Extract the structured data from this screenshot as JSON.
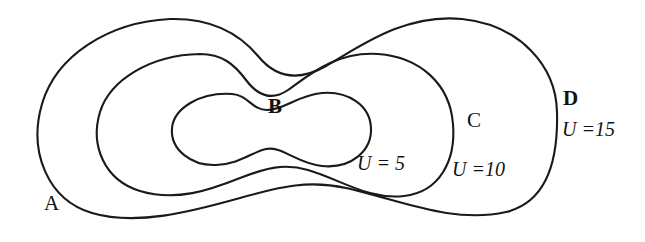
{
  "figure": {
    "type": "equipotential-contour-diagram",
    "background_color": "#ffffff",
    "line_color": "#1a1a1a",
    "region_labels": [
      {
        "id": "A",
        "text": "A",
        "style": "plain",
        "x": 44,
        "y": 193
      },
      {
        "id": "B",
        "text": "B",
        "style": "bold",
        "x": 268,
        "y": 96
      },
      {
        "id": "C",
        "text": "C",
        "style": "plain",
        "x": 467,
        "y": 110
      },
      {
        "id": "D",
        "text": "D",
        "style": "bold",
        "x": 563,
        "y": 88
      }
    ],
    "value_labels": [
      {
        "id": "u5",
        "variable": "U",
        "equals": "=",
        "value": "5",
        "text": "U = 5",
        "x": 357,
        "y": 153
      },
      {
        "id": "u10",
        "variable": "U",
        "equals": "=",
        "value": "10",
        "text": "U =10",
        "x": 452,
        "y": 159
      },
      {
        "id": "u15",
        "variable": "U",
        "equals": "=",
        "value": "15",
        "text": "U =15",
        "x": 562,
        "y": 119
      }
    ]
  },
  "chart_data": {
    "type": "line",
    "title": "",
    "xlabel": "",
    "ylabel": "",
    "grid": false,
    "legend": "none",
    "series": [
      {
        "name": "U = 5",
        "label": "U = 5",
        "value": 5,
        "region": "B",
        "closed": true,
        "shape": "peanut",
        "bbox": {
          "x_min": 170,
          "x_max": 372,
          "y_min": 93,
          "y_max": 167
        },
        "waist_x": 267,
        "path": "M 232 94 C 200 92 174 108 172 128 C 170 150 192 166 216 165 C 240 164 252 152 266 149 C 282 146 296 163 322 166 C 352 169 372 150 371 128 C 370 105 348 91 322 93 C 298 95 284 110 267 110 C 252 110 248 95 232 94 Z"
      },
      {
        "name": "U = 10",
        "label": "U =10",
        "value": 10,
        "region": "C",
        "closed": true,
        "shape": "peanut",
        "bbox": {
          "x_min": 96,
          "x_max": 456,
          "y_min": 53,
          "y_max": 200
        },
        "waist_x": 272,
        "path": "M 200 54 C 150 55 110 80 100 112 C 90 145 104 180 140 191 C 176 202 210 190 240 178 C 266 168 284 163 308 170 C 342 180 368 200 404 196 C 440 192 456 160 453 124 C 450 84 420 57 378 54 C 336 51 308 76 288 90 C 272 101 258 96 246 80 C 234 64 222 54 200 54 Z"
      },
      {
        "name": "U = 15",
        "label": "U =15",
        "value": 15,
        "region": "D",
        "closed": true,
        "shape": "peanut",
        "bbox": {
          "x_min": 38,
          "x_max": 558,
          "y_min": 18,
          "y_max": 222
        },
        "waist_x": 280,
        "path": "M 170 19 C 108 22 56 56 42 104 C 28 152 48 200 92 213 C 136 226 190 212 240 198 C 282 186 310 180 346 188 C 400 200 452 224 506 212 C 552 201 558 150 557 112 C 556 66 520 25 462 19 C 404 13 358 48 326 66 C 298 82 276 78 258 56 C 238 32 210 18 170 19 Z"
      }
    ]
  }
}
